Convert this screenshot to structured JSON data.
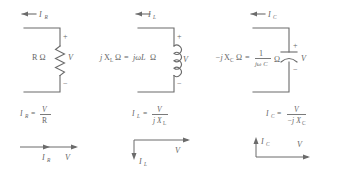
{
  "figure": {
    "title": "",
    "stroke_color": "#6b6b6b",
    "text_color": "#666666",
    "background": "#ffffff"
  },
  "panels": [
    {
      "id": "resistor",
      "element_name": "resistor",
      "element_symbol": "zigzag",
      "current_label": "I",
      "current_subscript": "R",
      "impedance_label": "R Ω",
      "impedance_label_parts": {
        "lead": "",
        "main": "R",
        "unit": "Ω",
        "equals": "",
        "rhs": ""
      },
      "voltage_label": "V",
      "polarity_plus": "+",
      "polarity_minus": "−",
      "equation": {
        "lhs": "I",
        "lhs_sub": "R",
        "equals": "=",
        "numerator": "V",
        "denominator": "R",
        "denominator_sub": ""
      },
      "phasor": {
        "current_label": "I",
        "current_sub": "R",
        "current_direction": "right",
        "voltage_label": "V",
        "voltage_direction": "right",
        "phase_note": "in phase"
      }
    },
    {
      "id": "inductor",
      "element_name": "inductor",
      "element_symbol": "coil",
      "current_label": "I",
      "current_subscript": "L",
      "impedance_label": "j X_L Ω = jωL Ω",
      "impedance_label_parts": {
        "lead": "j",
        "main": "X",
        "main_sub": "L",
        "unit": "Ω",
        "equals": "=",
        "rhs": "jωL",
        "rhs_unit": "Ω"
      },
      "voltage_label": "V",
      "polarity_plus": "+",
      "polarity_minus": "−",
      "equation": {
        "lhs": "I",
        "lhs_sub": "L",
        "equals": "=",
        "numerator": "V",
        "denominator": "j X",
        "denominator_sub": "L"
      },
      "phasor": {
        "current_label": "I",
        "current_sub": "L",
        "current_direction": "down",
        "voltage_label": "V",
        "voltage_direction": "right",
        "phase_note": "current lags voltage by 90°"
      }
    },
    {
      "id": "capacitor",
      "element_name": "capacitor",
      "element_symbol": "plates",
      "current_label": "I",
      "current_subscript": "C",
      "impedance_label": "−j X_C Ω = 1/(jωC) Ω",
      "impedance_label_parts": {
        "lead": "−j",
        "main": "X",
        "main_sub": "C",
        "unit": "Ω",
        "equals": "=",
        "rhs_num": "1",
        "rhs_den": "jω C",
        "rhs_unit": "Ω"
      },
      "voltage_label": "V",
      "polarity_plus": "+",
      "polarity_minus": "−",
      "equation": {
        "lhs": "I",
        "lhs_sub": "C",
        "equals": "=",
        "numerator": "V",
        "denominator": "−j X",
        "denominator_sub": "C"
      },
      "phasor": {
        "current_label": "I",
        "current_sub": "C",
        "current_direction": "up",
        "voltage_label": "V",
        "voltage_direction": "right",
        "phase_note": "current leads voltage by 90°"
      }
    }
  ]
}
